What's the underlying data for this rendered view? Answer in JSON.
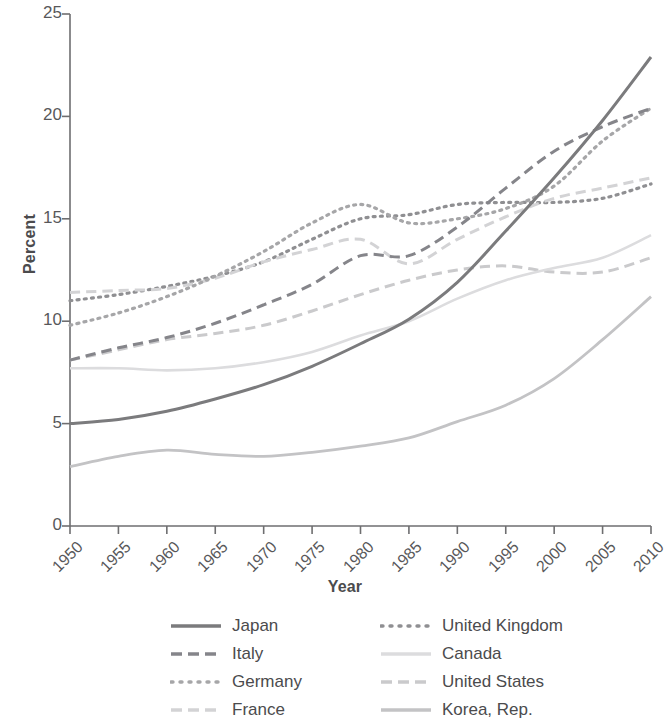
{
  "chart_data": {
    "type": "line",
    "title": "",
    "xlabel": "Year",
    "ylabel": "Percent",
    "xlim": [
      1950,
      2010
    ],
    "ylim": [
      0,
      25
    ],
    "xticks": [
      "1950",
      "1955",
      "1960",
      "1965",
      "1970",
      "1975",
      "1980",
      "1985",
      "1990",
      "1995",
      "2000",
      "2005",
      "2010"
    ],
    "yticks": [
      "0",
      "5",
      "10",
      "15",
      "20",
      "25"
    ],
    "grid": false,
    "legend_position": "bottom",
    "x": [
      1950,
      1955,
      1960,
      1965,
      1970,
      1975,
      1980,
      1985,
      1990,
      1995,
      2000,
      2005,
      2010
    ],
    "series": [
      {
        "name": "Japan",
        "color": "#7b7b7d",
        "style": "solid",
        "width": 3.0,
        "values": [
          5.0,
          5.2,
          5.6,
          6.2,
          6.9,
          7.8,
          8.9,
          10.1,
          11.9,
          14.4,
          17.0,
          19.8,
          22.9
        ]
      },
      {
        "name": "Italy",
        "color": "#85858a",
        "style": "dashed",
        "width": 3.0,
        "values": [
          8.1,
          8.7,
          9.2,
          9.9,
          10.8,
          11.8,
          13.2,
          13.2,
          14.6,
          16.5,
          18.3,
          19.5,
          20.4
        ]
      },
      {
        "name": "Germany",
        "color": "#a6a6a8",
        "style": "dotted",
        "width": 3.2,
        "values": [
          9.8,
          10.4,
          11.2,
          12.2,
          13.4,
          14.8,
          15.7,
          14.8,
          15.0,
          15.5,
          16.6,
          18.8,
          20.4
        ]
      },
      {
        "name": "France",
        "color": "#d3d3d5",
        "style": "dashed",
        "width": 3.0,
        "values": [
          11.4,
          11.5,
          11.6,
          12.1,
          12.9,
          13.5,
          14.0,
          12.8,
          14.0,
          15.1,
          16.0,
          16.5,
          17.0
        ]
      },
      {
        "name": "United Kingdom",
        "color": "#8f8f92",
        "style": "dotted",
        "width": 3.2,
        "values": [
          11.0,
          11.3,
          11.7,
          12.2,
          12.9,
          14.0,
          15.0,
          15.2,
          15.7,
          15.8,
          15.8,
          16.0,
          16.7
        ]
      },
      {
        "name": "Canada",
        "color": "#dcdcde",
        "style": "solid",
        "width": 2.6,
        "values": [
          7.7,
          7.7,
          7.6,
          7.7,
          8.0,
          8.5,
          9.3,
          10.0,
          11.1,
          12.0,
          12.6,
          13.1,
          14.2
        ]
      },
      {
        "name": "United States",
        "color": "#cacacc",
        "style": "dashed",
        "width": 3.0,
        "values": [
          8.1,
          8.6,
          9.1,
          9.4,
          9.8,
          10.5,
          11.3,
          12.0,
          12.5,
          12.7,
          12.4,
          12.4,
          13.1
        ]
      },
      {
        "name": "Korea, Rep.",
        "color": "#c3c3c5",
        "style": "solid",
        "width": 2.8,
        "values": [
          2.9,
          3.4,
          3.7,
          3.5,
          3.4,
          3.6,
          3.9,
          4.3,
          5.1,
          5.9,
          7.2,
          9.1,
          11.2
        ]
      }
    ]
  },
  "axes": {
    "y_title": "Percent",
    "x_title": "Year",
    "y_ticks": [
      "25",
      "20",
      "15",
      "10",
      "5",
      "0"
    ],
    "x_ticks": [
      "1950",
      "1955",
      "1960",
      "1965",
      "1970",
      "1975",
      "1980",
      "1985",
      "1990",
      "1995",
      "2000",
      "2005",
      "2010"
    ]
  },
  "legend": {
    "left_column": [
      {
        "label": "Japan",
        "color": "#7b7b7d",
        "style": "solid"
      },
      {
        "label": "Italy",
        "color": "#85858a",
        "style": "dashed"
      },
      {
        "label": "Germany",
        "color": "#a6a6a8",
        "style": "dotted"
      },
      {
        "label": "France",
        "color": "#d3d3d5",
        "style": "dashed"
      }
    ],
    "right_column": [
      {
        "label": "United Kingdom",
        "color": "#8f8f92",
        "style": "dotted"
      },
      {
        "label": "Canada",
        "color": "#dcdcde",
        "style": "solid"
      },
      {
        "label": "United States",
        "color": "#cacacc",
        "style": "dashed"
      },
      {
        "label": "Korea, Rep.",
        "color": "#c3c3c5",
        "style": "solid"
      }
    ]
  },
  "colors": {
    "axis": "#6e6e70",
    "text": "#58585a",
    "background": "#ffffff"
  }
}
